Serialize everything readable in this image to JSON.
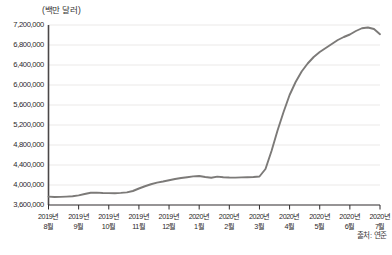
{
  "chart_data": {
    "type": "line",
    "title": "",
    "unit_label": "(백만 달러)",
    "xlabel": "",
    "ylabel": "",
    "ylim": [
      3600000,
      7200000
    ],
    "ytick_step": 400000,
    "ytick_labels": [
      "7,200,000",
      "6,800,000",
      "6,400,000",
      "6,000,000",
      "5,600,000",
      "5,200,000",
      "4,800,000",
      "4,400,000",
      "4,000,000",
      "3,600,000"
    ],
    "ytick_values": [
      7200000,
      6800000,
      6400000,
      6000000,
      5600000,
      5200000,
      4800000,
      4400000,
      4000000,
      3600000
    ],
    "categories": [
      "2019년 8월",
      "2019년 9월",
      "2019년 10월",
      "2019년 11월",
      "2019년 12월",
      "2020년 1월",
      "2020년 2월",
      "2020년 3월",
      "2020년 4월",
      "2020년 5월",
      "2020년 6월",
      "2020년 7월"
    ],
    "xtick_labels": [
      {
        "year": "2019년",
        "month": "8월"
      },
      {
        "year": "2019년",
        "month": "9월"
      },
      {
        "year": "2019년",
        "month": "10월"
      },
      {
        "year": "2019년",
        "month": "11월"
      },
      {
        "year": "2019년",
        "month": "12월"
      },
      {
        "year": "2020년",
        "month": "1월"
      },
      {
        "year": "2020년",
        "month": "2월"
      },
      {
        "year": "2020년",
        "month": "3월"
      },
      {
        "year": "2020년",
        "month": "4월"
      },
      {
        "year": "2020년",
        "month": "5월"
      },
      {
        "year": "2020년",
        "month": "6월"
      },
      {
        "year": "2020년",
        "month": "7월"
      }
    ],
    "grid": true,
    "legend": false,
    "series": [
      {
        "name": "연준 총자산",
        "color": "#7c7a78",
        "x": [
          0.0,
          0.2,
          0.4,
          0.6,
          0.8,
          1.0,
          1.2,
          1.4,
          1.6,
          1.8,
          2.0,
          2.2,
          2.4,
          2.6,
          2.8,
          3.0,
          3.2,
          3.4,
          3.6,
          3.8,
          4.0,
          4.2,
          4.4,
          4.6,
          4.8,
          5.0,
          5.2,
          5.4,
          5.6,
          5.8,
          6.0,
          6.2,
          6.4,
          6.6,
          6.8,
          7.0,
          7.2,
          7.4,
          7.6,
          7.8,
          8.0,
          8.2,
          8.4,
          8.6,
          8.8,
          9.0,
          9.2,
          9.4,
          9.6,
          9.8,
          10.0,
          10.2,
          10.4,
          10.6,
          10.8,
          11.0
        ],
        "values": [
          3768000,
          3760000,
          3762000,
          3768000,
          3775000,
          3792000,
          3820000,
          3845000,
          3848000,
          3840000,
          3838000,
          3836000,
          3842000,
          3852000,
          3880000,
          3930000,
          3975000,
          4015000,
          4048000,
          4070000,
          4095000,
          4120000,
          4140000,
          4155000,
          4172000,
          4180000,
          4160000,
          4145000,
          4168000,
          4155000,
          4150000,
          4148000,
          4152000,
          4155000,
          4160000,
          4170000,
          4320000,
          4680000,
          5090000,
          5460000,
          5800000,
          6060000,
          6270000,
          6430000,
          6560000,
          6660000,
          6740000,
          6820000,
          6900000,
          6960000,
          7010000,
          7080000,
          7135000,
          7150000,
          7120000,
          7015000
        ]
      }
    ],
    "source_note": "출처: 연준",
    "bottom_caption": ""
  }
}
